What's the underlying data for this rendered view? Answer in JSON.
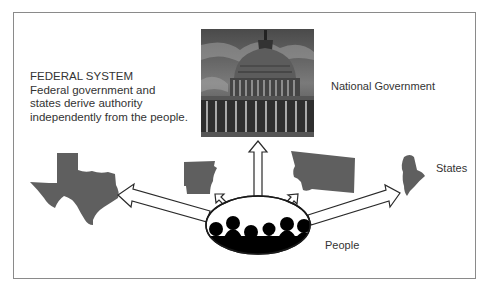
{
  "diagram": {
    "title": "FEDERAL SYSTEM",
    "description_lines": [
      "Federal government and",
      "states derive authority",
      "independently from the people."
    ],
    "nodes": {
      "national": {
        "label": "National Government",
        "image": "us-capitol-building"
      },
      "states": {
        "label": "States",
        "shapes": [
          "texas",
          "arkansas",
          "montana",
          "maine"
        ]
      },
      "people": {
        "label": "People",
        "image": "crowd-silhouettes"
      }
    },
    "arrows": [
      {
        "from": "people",
        "to": "texas"
      },
      {
        "from": "people",
        "to": "arkansas"
      },
      {
        "from": "people",
        "to": "national"
      },
      {
        "from": "people",
        "to": "montana"
      },
      {
        "from": "people",
        "to": "maine"
      }
    ],
    "colors": {
      "state_fill": "#5f5f5f",
      "frame": "#8a8a8a",
      "text": "#333333",
      "people_fill": "#000000"
    }
  }
}
